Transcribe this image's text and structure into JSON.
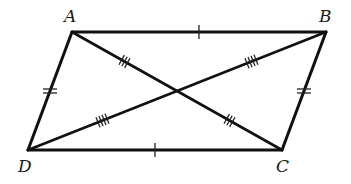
{
  "figure": {
    "type": "parallelogram-with-diagonals",
    "width": 351,
    "height": 184,
    "stroke_color": "#111111",
    "background": "#ffffff"
  },
  "vertices": {
    "A": {
      "label": "A",
      "x": 72,
      "y": 32,
      "label_x": 64,
      "label_y": 22
    },
    "B": {
      "label": "B",
      "x": 326,
      "y": 32,
      "label_x": 319,
      "label_y": 22
    },
    "C": {
      "label": "C",
      "x": 282,
      "y": 150,
      "label_x": 276,
      "label_y": 172
    },
    "D": {
      "label": "D",
      "x": 28,
      "y": 150,
      "label_x": 18,
      "label_y": 172
    }
  },
  "intersection": {
    "x": 177,
    "y": 91
  },
  "sides": [
    {
      "name": "AB",
      "from": "A",
      "to": "B",
      "ticks": 1
    },
    {
      "name": "BC",
      "from": "B",
      "to": "C",
      "ticks": 2
    },
    {
      "name": "CD",
      "from": "C",
      "to": "D",
      "ticks": 1
    },
    {
      "name": "DA",
      "from": "D",
      "to": "A",
      "ticks": 2
    }
  ],
  "diagonals": [
    {
      "name": "AC",
      "from": "A",
      "to": "C",
      "segment_ticks": 3
    },
    {
      "name": "BD",
      "from": "B",
      "to": "D",
      "segment_ticks": 4
    }
  ],
  "labels": {
    "A": "A",
    "B": "B",
    "C": "C",
    "D": "D"
  }
}
